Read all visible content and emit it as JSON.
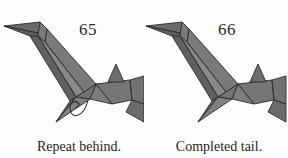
{
  "document": {
    "type": "origami-instruction-diagram",
    "background_color": "#fdfdfd",
    "panel_count": 2
  },
  "palette": {
    "paper_light": "#8d8d8d",
    "paper_mid": "#7a7a7a",
    "paper_dark": "#6a6a6a",
    "paper_darker": "#5e5e5e",
    "outline": "#2a2a2a",
    "fold_line": "#3a3a3a",
    "arrow": "#303030",
    "text": "#1d1d1d",
    "background": "#fdfdfd"
  },
  "panels": [
    {
      "id": "left",
      "step_number": "65",
      "caption": "Repeat behind.",
      "model_name": "origami-bird-tail-step-65",
      "has_repeat_behind_arrow": true,
      "arrow_name": "repeat-behind-arrow"
    },
    {
      "id": "right",
      "step_number": "66",
      "caption": "Completed tail.",
      "model_name": "origami-bird-tail-step-66",
      "has_repeat_behind_arrow": false,
      "arrow_name": ""
    }
  ]
}
